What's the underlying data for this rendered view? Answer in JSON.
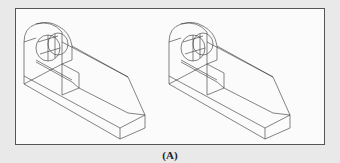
{
  "figure": {
    "caption": "(A)",
    "panels": [
      {
        "id": "left",
        "description": "Isometric wireframe of bracket block with arched upright and cylindrical hole",
        "offset_x": 0
      },
      {
        "id": "right",
        "description": "Isometric wireframe of bracket block with arched upright and cylindrical hole (duplicate view)",
        "offset_x": 145
      }
    ],
    "colors": {
      "line": "#333333",
      "frame": "#555555",
      "background": "#e9e9e9",
      "panel": "#fbfbfb"
    }
  }
}
